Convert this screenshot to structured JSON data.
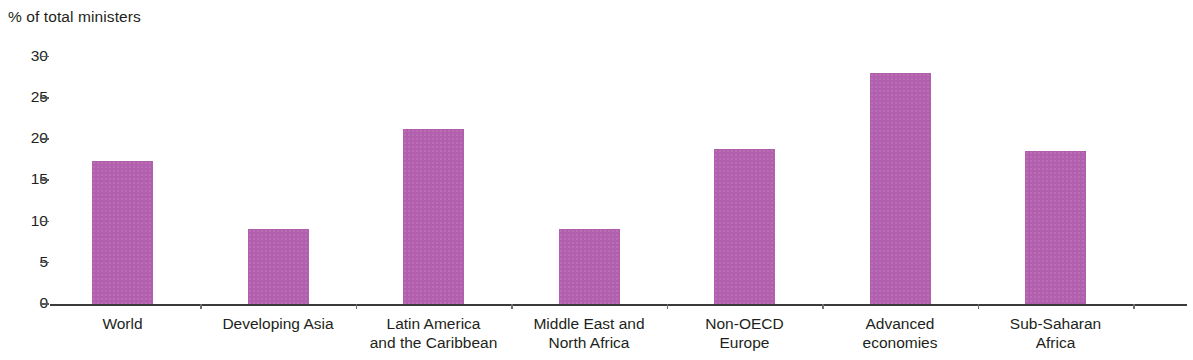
{
  "chart_data": {
    "type": "bar",
    "title": "",
    "xlabel": "",
    "ylabel": "% of total ministers",
    "ylim": [
      0,
      30
    ],
    "yticks": [
      0,
      5,
      10,
      15,
      20,
      25,
      30
    ],
    "ytick_labels": [
      "0",
      "5",
      "10",
      "15",
      "20",
      "25",
      "30"
    ],
    "grid": false,
    "legend": "none",
    "bar_color": "#b25fae",
    "axis_color": "#3a3a3a",
    "categories": [
      "World",
      "Developing Asia",
      "Latin America and the Caribbean",
      "Middle East and North Africa",
      "Non-OECD Europe",
      "Advanced economies",
      "Sub-Saharan Africa"
    ],
    "category_lines": [
      [
        "World"
      ],
      [
        "Developing Asia"
      ],
      [
        "Latin America",
        "and the Caribbean"
      ],
      [
        "Middle East and",
        "North Africa"
      ],
      [
        "Non-OECD",
        "Europe"
      ],
      [
        "Advanced",
        "economies"
      ],
      [
        "Sub-Saharan",
        "Africa"
      ]
    ],
    "values": [
      17.3,
      9.1,
      21.2,
      9.1,
      18.8,
      28.0,
      18.6
    ]
  }
}
